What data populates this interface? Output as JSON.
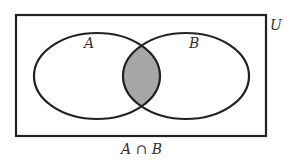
{
  "diagram": {
    "type": "venn",
    "universe_label": "U",
    "sets": [
      {
        "label": "A"
      },
      {
        "label": "B"
      }
    ],
    "shaded_region": "intersection",
    "caption": "A ∩ B",
    "colors": {
      "stroke": "#222222",
      "shade": "#a6a6a6",
      "background": "#ffffff"
    }
  }
}
